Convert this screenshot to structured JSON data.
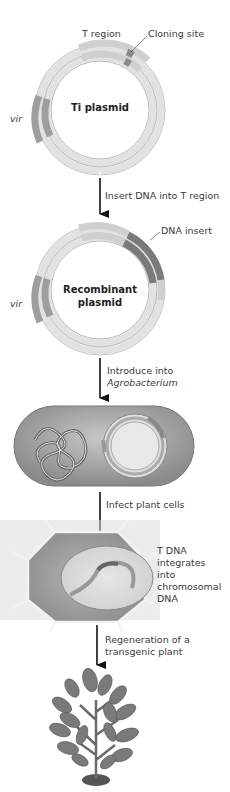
{
  "figure": {
    "step1": {
      "plasmid_label": "Ti plasmid",
      "t_region_label": "T region",
      "cloning_site_label": "Cloning site",
      "vir_label": "vir"
    },
    "arrow1": {
      "label": "Insert DNA into T region"
    },
    "step2": {
      "plasmid_label_line1": "Recombinant",
      "plasmid_label_line2": "plasmid",
      "dna_insert_label": "DNA insert",
      "vir_label": "vir"
    },
    "arrow2": {
      "label_line1": "Introduce into",
      "label_line2": "Agrobacterium"
    },
    "arrow3": {
      "label": "Infect plant cells"
    },
    "step4": {
      "note_lines": [
        "T DNA",
        "integrates",
        "into",
        "chromosomal",
        "DNA"
      ]
    },
    "arrow4": {
      "label_line1": "Regeneration of a",
      "label_line2": "transgenic plant"
    }
  },
  "colors": {
    "ring_light": "#d9d9d9",
    "ring_mid": "#c4c4c4",
    "ring_dark": "#8f8f8f",
    "insert_dark": "#6e6e6e",
    "cell_fill": "#9a9a9a",
    "plant_leaf": "#7a7a7a",
    "arrow": "#111111"
  }
}
